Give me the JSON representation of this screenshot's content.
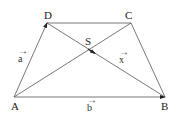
{
  "diagram": {
    "type": "trapezoid-vector",
    "points": {
      "A": {
        "label": "A",
        "x": 14,
        "y": 97
      },
      "B": {
        "label": "B",
        "x": 165,
        "y": 97
      },
      "C": {
        "label": "C",
        "x": 131,
        "y": 23
      },
      "D": {
        "label": "D",
        "x": 47,
        "y": 23
      },
      "S": {
        "label": "S",
        "x": 90,
        "y": 50
      }
    },
    "vectors": {
      "a": {
        "label": "a",
        "arrow": "→",
        "from": "A",
        "to": "D"
      },
      "b": {
        "label": "b",
        "arrow": "→",
        "from": "A",
        "to": "B"
      },
      "x": {
        "label": "x",
        "arrow": "→",
        "from": "D",
        "to": "B"
      }
    },
    "line_color": "#555555",
    "text_color": "#222222"
  }
}
